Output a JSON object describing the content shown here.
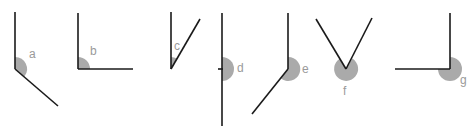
{
  "diagram": {
    "title": "",
    "colors": {
      "line": "#1a1a1a",
      "sector": "#aaaaaa",
      "label": "#9a9a9a",
      "background": "#ffffff"
    },
    "angles": [
      {
        "label": "a",
        "type": "obtuse"
      },
      {
        "label": "b",
        "type": "right"
      },
      {
        "label": "c",
        "type": "acute"
      },
      {
        "label": "d",
        "type": "straight"
      },
      {
        "label": "e",
        "type": "reflex"
      },
      {
        "label": "f",
        "type": "reflex"
      },
      {
        "label": "g",
        "type": "reflex"
      }
    ]
  }
}
